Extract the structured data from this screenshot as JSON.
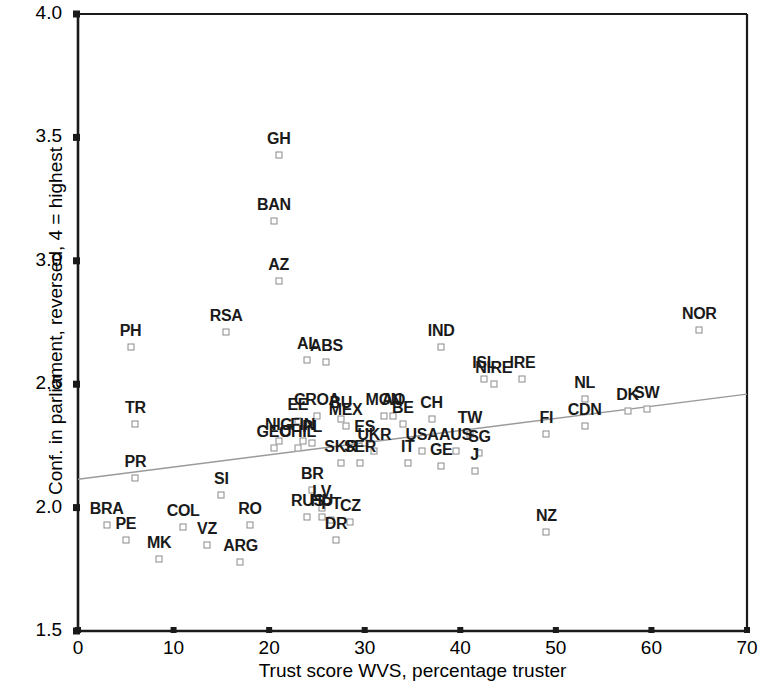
{
  "chart_data": {
    "type": "scatter",
    "title": "",
    "xlabel": "Trust score WVS, percentage truster",
    "ylabel": "Conf. in parliament, reversed, 4 = highest",
    "xlim": [
      0,
      70
    ],
    "ylim": [
      1.5,
      4.0
    ],
    "xticks": [
      "0",
      "10",
      "20",
      "30",
      "40",
      "50",
      "60",
      "70"
    ],
    "yticks": [
      "1.5",
      "2.0",
      "2.5",
      "3.0",
      "3.5",
      "4.0"
    ],
    "xtick_values": [
      0,
      10,
      20,
      30,
      40,
      50,
      60,
      70
    ],
    "ytick_values": [
      1.5,
      2.0,
      2.5,
      3.0,
      3.5,
      4.0
    ],
    "grid": false,
    "legend": "none",
    "marker_style": "open-square",
    "trendline": {
      "label": "linear fit",
      "x0": 0,
      "y0": 2.115,
      "x1": 70,
      "y1": 2.46,
      "color": "#9a9a9a"
    },
    "points": [
      {
        "label": "GH",
        "x": 21.0,
        "y": 3.43
      },
      {
        "label": "BAN",
        "x": 20.5,
        "y": 3.16
      },
      {
        "label": "AZ",
        "x": 21.0,
        "y": 2.92
      },
      {
        "label": "NOR",
        "x": 65.0,
        "y": 2.72
      },
      {
        "label": "RSA",
        "x": 15.5,
        "y": 2.71
      },
      {
        "label": "PH",
        "x": 5.5,
        "y": 2.65
      },
      {
        "label": "IND",
        "x": 38.0,
        "y": 2.65
      },
      {
        "label": "AL",
        "x": 24.0,
        "y": 2.6
      },
      {
        "label": "ABS",
        "x": 26.0,
        "y": 2.59
      },
      {
        "label": "ISL",
        "x": 42.5,
        "y": 2.52
      },
      {
        "label": "NIRE",
        "x": 43.5,
        "y": 2.5
      },
      {
        "label": "IRE",
        "x": 46.5,
        "y": 2.52
      },
      {
        "label": "NL",
        "x": 53.0,
        "y": 2.44
      },
      {
        "label": "SW",
        "x": 59.5,
        "y": 2.4
      },
      {
        "label": "DK",
        "x": 57.5,
        "y": 2.39
      },
      {
        "label": "CDN",
        "x": 53.0,
        "y": 2.33
      },
      {
        "label": "CROA",
        "x": 25.0,
        "y": 2.37
      },
      {
        "label": "EE",
        "x": 23.0,
        "y": 2.35
      },
      {
        "label": "BU",
        "x": 27.5,
        "y": 2.36
      },
      {
        "label": "MON",
        "x": 32.0,
        "y": 2.37
      },
      {
        "label": "AO",
        "x": 33.0,
        "y": 2.37
      },
      {
        "label": "BE",
        "x": 34.0,
        "y": 2.34
      },
      {
        "label": "CH",
        "x": 37.0,
        "y": 2.36
      },
      {
        "label": "MEX",
        "x": 28.0,
        "y": 2.33
      },
      {
        "label": "TW",
        "x": 41.0,
        "y": 2.3
      },
      {
        "label": "FI",
        "x": 49.0,
        "y": 2.3
      },
      {
        "label": "TR",
        "x": 6.0,
        "y": 2.34
      },
      {
        "label": "NIG",
        "x": 21.0,
        "y": 2.27
      },
      {
        "label": "FIN",
        "x": 23.5,
        "y": 2.27
      },
      {
        "label": "GEO",
        "x": 20.5,
        "y": 2.24
      },
      {
        "label": "CHIL",
        "x": 23.0,
        "y": 2.24
      },
      {
        "label": "PL",
        "x": 24.5,
        "y": 2.26
      },
      {
        "label": "ES",
        "x": 30.0,
        "y": 2.26
      },
      {
        "label": "UKR",
        "x": 31.0,
        "y": 2.23
      },
      {
        "label": "USA",
        "x": 36.0,
        "y": 2.23
      },
      {
        "label": "AUS",
        "x": 39.5,
        "y": 2.23
      },
      {
        "label": "SG",
        "x": 42.0,
        "y": 2.22
      },
      {
        "label": "SKR",
        "x": 27.5,
        "y": 2.18
      },
      {
        "label": "SER",
        "x": 29.5,
        "y": 2.18
      },
      {
        "label": "IT",
        "x": 34.5,
        "y": 2.18
      },
      {
        "label": "GE",
        "x": 38.0,
        "y": 2.17
      },
      {
        "label": "J",
        "x": 41.5,
        "y": 2.15
      },
      {
        "label": "PR",
        "x": 6.0,
        "y": 2.12
      },
      {
        "label": "SI",
        "x": 15.0,
        "y": 2.05
      },
      {
        "label": "BR",
        "x": 24.5,
        "y": 2.07
      },
      {
        "label": "LV",
        "x": 25.5,
        "y": 2.0
      },
      {
        "label": "RUS",
        "x": 24.0,
        "y": 1.96
      },
      {
        "label": "HU",
        "x": 25.5,
        "y": 1.96
      },
      {
        "label": "PT",
        "x": 26.5,
        "y": 1.95
      },
      {
        "label": "CZ",
        "x": 28.5,
        "y": 1.94
      },
      {
        "label": "DR",
        "x": 27.0,
        "y": 1.87
      },
      {
        "label": "RO",
        "x": 18.0,
        "y": 1.93
      },
      {
        "label": "COL",
        "x": 11.0,
        "y": 1.92
      },
      {
        "label": "VZ",
        "x": 13.5,
        "y": 1.85
      },
      {
        "label": "BRA",
        "x": 3.0,
        "y": 1.93
      },
      {
        "label": "PE",
        "x": 5.0,
        "y": 1.87
      },
      {
        "label": "MK",
        "x": 8.5,
        "y": 1.79
      },
      {
        "label": "ARG",
        "x": 17.0,
        "y": 1.78
      },
      {
        "label": "NZ",
        "x": 49.0,
        "y": 1.9
      }
    ]
  }
}
